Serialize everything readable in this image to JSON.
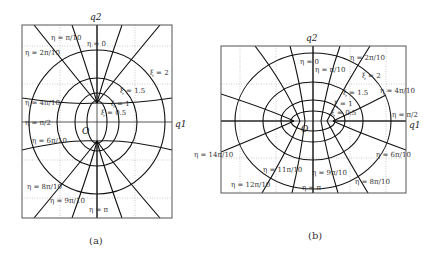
{
  "panels": [
    {
      "id": "a",
      "caption": "(a)",
      "axis_x": "q1",
      "axis_y": "q2",
      "origin_label": "O",
      "xi_labels": [
        "ξ = 2",
        "ξ = 1.5",
        "ξ = 1",
        "ξ = 0.5"
      ],
      "eta_labels": [
        "η = π/10",
        "η = 0",
        "η = 2π/10",
        "η = 4π/10",
        "η = π/2",
        "η = 6π/10",
        "η = 8π/10",
        "η = 9π/10",
        "η = π"
      ]
    },
    {
      "id": "b",
      "caption": "(b)",
      "axis_x": "q1",
      "axis_y": "q2",
      "origin_label": "O",
      "xi_labels": [
        "ξ = 2",
        "ξ = 1.5",
        "ξ = 1",
        "ξ = 0.5"
      ],
      "eta_labels": [
        "η = 0",
        "η = π/10",
        "η = 2π/10",
        "η = 4π/10",
        "η = π/2",
        "η = 6π/10",
        "η = 14π/10",
        "η = 11π/10",
        "η = 9π/10",
        "η = 12π/10",
        "η = π",
        "η = 8π/10"
      ]
    }
  ]
}
